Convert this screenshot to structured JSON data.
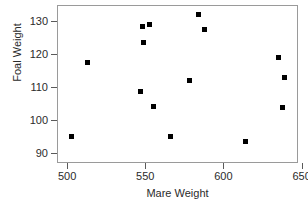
{
  "chart_data": {
    "type": "scatter",
    "title": "",
    "xlabel": "Mare Weight",
    "ylabel": "Foal Weight",
    "xlim": [
      493.5,
      647.7
    ],
    "ylim": [
      87.1,
      134.8
    ],
    "grid": false,
    "legend": null,
    "xticks": [
      500,
      550,
      600,
      650
    ],
    "xticklabels": [
      "500",
      "550",
      "600",
      "650"
    ],
    "yticks": [
      90,
      100,
      110,
      120,
      130
    ],
    "yticklabels": [
      "90",
      "100",
      "110",
      "120",
      "130"
    ],
    "marker": "square",
    "marker_color": "#000000",
    "points": [
      {
        "x": 503,
        "y": 95.2
      },
      {
        "x": 513,
        "y": 117.5
      },
      {
        "x": 547,
        "y": 108.6
      },
      {
        "x": 548,
        "y": 128.2
      },
      {
        "x": 549,
        "y": 123.6
      },
      {
        "x": 553,
        "y": 128.8
      },
      {
        "x": 555,
        "y": 104.2
      },
      {
        "x": 566,
        "y": 95.0
      },
      {
        "x": 578,
        "y": 112.1
      },
      {
        "x": 584,
        "y": 131.9
      },
      {
        "x": 588,
        "y": 127.5
      },
      {
        "x": 614,
        "y": 93.6
      },
      {
        "x": 635,
        "y": 119.0
      },
      {
        "x": 639,
        "y": 113.0
      },
      {
        "x": 638,
        "y": 104.0
      }
    ]
  }
}
